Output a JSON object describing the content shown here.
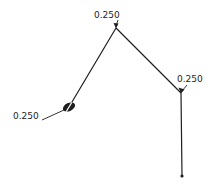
{
  "drawing": {
    "background": "#ffffff",
    "stroke_color": "#1e1e1e",
    "tube_path_points": "69,107 116,28 181,93 182,176",
    "leader_lines": [
      {
        "name": "leader-left",
        "x1": 42,
        "y1": 120,
        "x2": 64,
        "y2": 110
      },
      {
        "name": "leader-top",
        "x1": 118,
        "y1": 20,
        "x2": 116,
        "y2": 26
      },
      {
        "name": "leader-right",
        "x1": 187,
        "y1": 85,
        "x2": 182,
        "y2": 91
      }
    ],
    "arrowheads": [
      {
        "name": "arrowhead-top",
        "points": "113.5,23 116,28.5 118.5,23.5"
      },
      {
        "name": "arrowhead-right",
        "points": "178.5,87.5 181,93.5 184.5,89.5"
      }
    ],
    "bend_marker": {
      "cx": 69,
      "cy": 107,
      "rx": 6.5,
      "ry": 4,
      "rotation": -25,
      "slash_color": "#ffffff"
    },
    "end_point": {
      "cx": 182,
      "cy": 176,
      "r": 1.6
    }
  },
  "labels": [
    {
      "text": "0.250",
      "position": "top"
    },
    {
      "text": "0.250",
      "position": "right"
    },
    {
      "text": "0.250",
      "position": "left"
    }
  ]
}
